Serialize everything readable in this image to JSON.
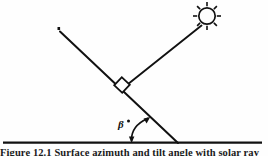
{
  "figure": {
    "title_visible_fragment": "Figure 12.1 Solar ray incidence angle",
    "caption": "Figure 12.1  Surface azimuth and tilt angle with solar ray",
    "ink_color": "#111111",
    "background_color": "#ffffff",
    "labels": {
      "angle": "β",
      "angle_superscript": "•",
      "ray_tick": "’"
    },
    "elements": [
      {
        "name": "sun-icon",
        "kind": "sun",
        "cx": 207,
        "cy": 16,
        "r": 8,
        "ray_count": 8
      },
      {
        "name": "sun-ray-line",
        "kind": "line",
        "x1": 200,
        "y1": 27,
        "x2": 128,
        "y2": 84
      },
      {
        "name": "inclined-surface-line",
        "kind": "line",
        "x1": 60,
        "y1": 31,
        "x2": 178,
        "y2": 143
      },
      {
        "name": "right-angle-marker",
        "kind": "square",
        "cx": 122,
        "cy": 85,
        "size": 11
      },
      {
        "name": "ground-line",
        "kind": "line",
        "x1": 3,
        "y1": 143,
        "x2": 262,
        "y2": 143
      },
      {
        "name": "angle-arc",
        "kind": "arc",
        "cx": 160,
        "cy": 143,
        "r": 32
      }
    ]
  }
}
